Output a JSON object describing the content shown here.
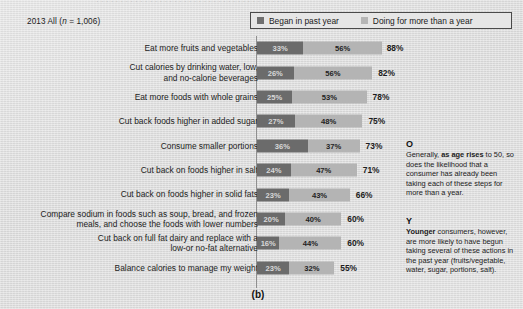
{
  "figure": {
    "caption": "(b)",
    "cutoff_text": "· · · · · · · · · · · · · · · · · · · · · · · · · · · · · · · · · · · · · · ·"
  },
  "header": {
    "series_prefix": "2013 All (",
    "series_italic": "n",
    "series_suffix": " = 1,006)"
  },
  "legend": {
    "items": [
      {
        "label": "Began in past year",
        "color": "#6b6b6b"
      },
      {
        "label": "Doing for more than a year",
        "color": "#b4b4b4"
      }
    ]
  },
  "annotations": [
    {
      "mark": "O",
      "prefix": "Generally, ",
      "bold": "as age rises",
      "suffix": " to 50, so does the likelihood that a consumer has already been taking each of these steps for more than a year."
    },
    {
      "mark": "Y",
      "prefix": "",
      "bold": "Younger",
      "suffix": " consumers, however, are more likely to have begun taking several of these actions in the past year (fruits/vegetable, water, sugar, portions, salt)."
    }
  ],
  "chart_data": {
    "type": "bar",
    "title": "",
    "subtitle": "2013 All (n = 1,006)",
    "orientation": "horizontal",
    "stacked": true,
    "xlabel": "",
    "ylabel": "",
    "xlim": [
      0,
      100
    ],
    "grid": false,
    "legend_position": "top-right",
    "categories": [
      "Eat more fruits and vegetables",
      "Cut calories by drinking water, low,\nand no-calorie beverages",
      "Eat more foods with whole grains",
      "Cut back foods higher in added sugar",
      "Consume smaller portions",
      "Cut back on foods higher in salt",
      "Cut back on foods higher in solid fats",
      "Compare sodium in foods such as soup, bread, and frozen\nmeals, and choose the foods with lower numbers",
      "Cut back on full fat dairy and replace with a\nlow-or no-fat alternative",
      "Balance calories to manage my weight"
    ],
    "series": [
      {
        "name": "Began in past year",
        "color": "#6b6b6b",
        "values": [
          33,
          26,
          25,
          27,
          36,
          24,
          23,
          20,
          16,
          23
        ]
      },
      {
        "name": "Doing for more than a year",
        "color": "#b4b4b4",
        "values": [
          56,
          56,
          53,
          48,
          37,
          47,
          43,
          40,
          44,
          32
        ]
      }
    ],
    "totals": [
      88,
      82,
      78,
      75,
      73,
      71,
      66,
      60,
      60,
      55
    ],
    "value_label_suffix": "%"
  }
}
